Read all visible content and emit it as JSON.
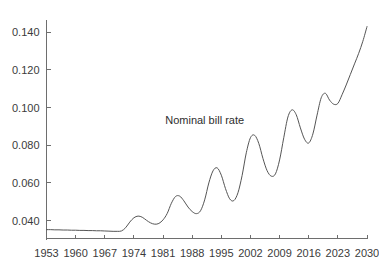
{
  "chart_data": {
    "type": "line",
    "title": "",
    "subtitle": "",
    "xlabel": "",
    "ylabel": "",
    "grid": false,
    "legend_position": "none",
    "annotations": [
      {
        "text": "Nominal bill rate",
        "x": 1991,
        "y": 0.0935
      }
    ],
    "xlim": [
      1953,
      2030
    ],
    "ylim": [
      0.0305,
      0.1465
    ],
    "xticks": [
      1953,
      1960,
      1967,
      1974,
      1981,
      1988,
      1995,
      2002,
      2009,
      2016,
      2023,
      2030
    ],
    "xtick_labels": [
      "1953",
      "1960",
      "1967",
      "1974",
      "1981",
      "1988",
      "1995",
      "2002",
      "2009",
      "2016",
      "2023",
      "2030"
    ],
    "yticks": [
      0.04,
      0.06,
      0.08,
      0.1,
      0.12,
      0.14
    ],
    "ytick_labels": [
      "0.040",
      "0.060",
      "0.080",
      "0.100",
      "0.120",
      "0.140"
    ],
    "line_color": "#555555",
    "line_width": 1,
    "series": [
      {
        "name": "Nominal bill rate",
        "x": [
          1953,
          1954,
          1955,
          1956,
          1957,
          1958,
          1959,
          1960,
          1961,
          1962,
          1963,
          1964,
          1965,
          1966,
          1967,
          1968,
          1969,
          1970,
          1971,
          1972,
          1973,
          1974,
          1975,
          1976,
          1977,
          1978,
          1979,
          1980,
          1981,
          1982,
          1983,
          1984,
          1985,
          1986,
          1987,
          1988,
          1989,
          1990,
          1991,
          1992,
          1993,
          1994,
          1995,
          1996,
          1997,
          1998,
          1999,
          2000,
          2001,
          2002,
          2003,
          2004,
          2005,
          2006,
          2007,
          2008,
          2009,
          2010,
          2011,
          2012,
          2013,
          2014,
          2015,
          2016,
          2017,
          2018,
          2019,
          2020,
          2021,
          2022,
          2023,
          2024,
          2025,
          2026,
          2027,
          2028,
          2029,
          2030
        ],
        "values": [
          0.0352,
          0.0352,
          0.0351,
          0.0351,
          0.035,
          0.035,
          0.0349,
          0.0349,
          0.0348,
          0.0348,
          0.0347,
          0.0347,
          0.0346,
          0.0346,
          0.0345,
          0.0344,
          0.0343,
          0.0343,
          0.0345,
          0.0362,
          0.0392,
          0.0415,
          0.0424,
          0.0418,
          0.0402,
          0.0388,
          0.0381,
          0.0385,
          0.0404,
          0.0438,
          0.0492,
          0.0528,
          0.053,
          0.0505,
          0.0472,
          0.0448,
          0.0437,
          0.0452,
          0.051,
          0.06,
          0.0664,
          0.068,
          0.0641,
          0.057,
          0.0516,
          0.0506,
          0.0548,
          0.064,
          0.076,
          0.084,
          0.0853,
          0.081,
          0.073,
          0.0665,
          0.0636,
          0.0648,
          0.0722,
          0.084,
          0.095,
          0.0988,
          0.0962,
          0.0892,
          0.0832,
          0.0812,
          0.086,
          0.096,
          0.1052,
          0.1076,
          0.104,
          0.1018,
          0.1022,
          0.1068,
          0.112,
          0.1176,
          0.1232,
          0.1288,
          0.1352,
          0.143
        ]
      }
    ]
  },
  "axes": {
    "y_tick_labels": [
      "0.140",
      "0.120",
      "0.100",
      "0.080",
      "0.060",
      "0.040"
    ],
    "x_tick_labels": [
      "1953",
      "1960",
      "1967",
      "1974",
      "1981",
      "1988",
      "1995",
      "2002",
      "2009",
      "2016",
      "2023",
      "2030"
    ]
  },
  "annotation": {
    "text": "Nominal bill rate"
  },
  "style": {
    "axis_color": "#6e6e6e",
    "line_color": "#555555",
    "text_color": "#3b3b3b",
    "background": "#ffffff"
  }
}
